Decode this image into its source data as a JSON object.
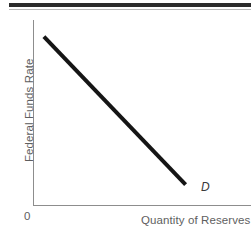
{
  "figure": {
    "background_color": "#ffffff",
    "top_rule": {
      "thick_color": "#2b2b2b",
      "thin_color": "#b9b9b9"
    }
  },
  "axes": {
    "color": "#8d8d8d",
    "origin_label": "0"
  },
  "labels": {
    "y_axis": "Federal Funds Rate",
    "x_axis": "Quantity of Reserves",
    "curve": "D"
  },
  "chart_data": {
    "type": "line",
    "title": "",
    "subtitle": "",
    "xlabel": "Quantity of Reserves",
    "ylabel": "Federal Funds Rate",
    "grid": false,
    "legend": null,
    "xlim": [
      0,
      100
    ],
    "ylim": [
      0,
      100
    ],
    "xticks": [],
    "yticks": [],
    "xticklabels": [],
    "yticklabels": [],
    "origin_annotation": "0",
    "series": [
      {
        "name": "D",
        "label": "D",
        "description": "Downward-sloping demand curve for reserves",
        "color": "#151515",
        "linewidth": 4,
        "x": [
          5,
          70
        ],
        "y": [
          91,
          11
        ],
        "annotation": {
          "text": "D",
          "x": 77,
          "y": 7,
          "style": "italic"
        }
      }
    ]
  }
}
